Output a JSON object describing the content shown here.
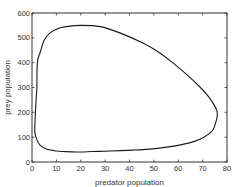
{
  "chart_data": {
    "type": "line",
    "title": "",
    "xlabel": "predator population",
    "ylabel": "prey population",
    "xlim": [
      0,
      80
    ],
    "ylim": [
      0,
      600
    ],
    "xticks": [
      0,
      10,
      20,
      30,
      40,
      50,
      60,
      70,
      80
    ],
    "yticks": [
      0,
      100,
      200,
      300,
      400,
      500,
      600
    ],
    "grid": false,
    "legend": null,
    "series": [
      {
        "name": "phase-plane trajectory (closed orbit)",
        "x": [
          2.0,
          2.2,
          3.3,
          5.0,
          7.4,
          10.5,
          14.0,
          20.0,
          28.0,
          36.0,
          45.5,
          52.0,
          57.8,
          63.5,
          68.9,
          72.5,
          75.0,
          76.0,
          75.8,
          74.2,
          70.5,
          66.0,
          60.5,
          55.3,
          48.0,
          41.4,
          32.0,
          25.0,
          18.4,
          13.0,
          10.2,
          6.0,
          3.3,
          2.0,
          1.2,
          1.2,
          1.5,
          2.0
        ],
        "y": [
          300,
          400,
          440,
          490,
          520,
          537,
          545,
          550,
          545,
          520,
          479,
          442,
          399,
          352,
          302,
          262,
          225,
          200,
          175,
          129,
          100,
          81,
          68,
          60,
          52,
          48,
          44,
          42,
          40,
          42,
          44,
          52,
          68,
          90,
          117,
          150,
          220,
          300
        ]
      }
    ]
  },
  "axes": {
    "xlabel": "predator population",
    "ylabel": "prey population",
    "xtick_labels": [
      "0",
      "10",
      "20",
      "30",
      "40",
      "50",
      "60",
      "70",
      "80"
    ],
    "ytick_labels": [
      "0",
      "100",
      "200",
      "300",
      "400",
      "500",
      "600"
    ]
  }
}
